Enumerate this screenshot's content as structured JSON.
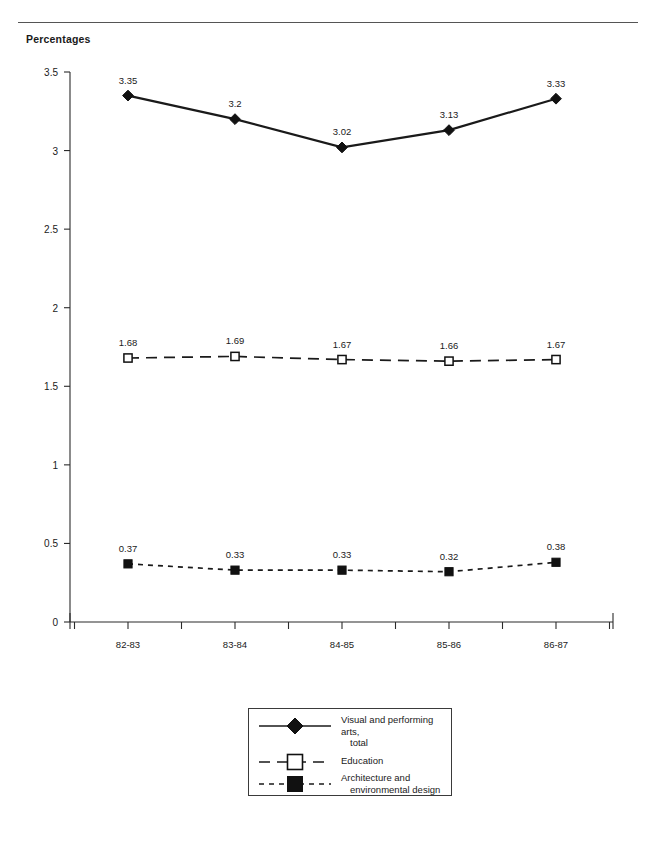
{
  "figure": {
    "axis_title": "Percentages",
    "top_rule": true
  },
  "chart_data": {
    "type": "line",
    "title": "",
    "subtitle": "",
    "xlabel": "",
    "ylabel": "Percentages",
    "categories": [
      "82-83",
      "83-84",
      "84-85",
      "85-86",
      "86-87"
    ],
    "ylim": [
      0,
      3.5
    ],
    "ytick_labels": [
      "0",
      "0.5",
      "1",
      "1.5",
      "2",
      "2.5",
      "3",
      "3.5"
    ],
    "ytick_values": [
      0,
      0.5,
      1,
      1.5,
      2,
      2.5,
      3,
      3.5
    ],
    "grid": false,
    "legend_position": "bottom-center",
    "series": [
      {
        "name": "Visual and performing arts, total",
        "legend_line1": "Visual and performing arts,",
        "legend_line2": "total",
        "marker": "filled-diamond",
        "line_style": "solid",
        "color": "#1a1a1a",
        "values": [
          3.35,
          3.2,
          3.02,
          3.13,
          3.33
        ],
        "labels": [
          "3.35",
          "3.2",
          "3.02",
          "3.13",
          "3.33"
        ]
      },
      {
        "name": "Education",
        "legend_line1": "Education",
        "legend_line2": "",
        "marker": "open-square",
        "line_style": "long-dash",
        "color": "#1a1a1a",
        "values": [
          1.68,
          1.69,
          1.67,
          1.66,
          1.67
        ],
        "labels": [
          "1.68",
          "1.69",
          "1.67",
          "1.66",
          "1.67"
        ]
      },
      {
        "name": "Architecture and environmental design",
        "legend_line1": "Architecture and",
        "legend_line2": "environmental design",
        "marker": "filled-square",
        "line_style": "short-dash",
        "color": "#1a1a1a",
        "values": [
          0.37,
          0.33,
          0.33,
          0.32,
          0.38
        ],
        "labels": [
          "0.37",
          "0.33",
          "0.33",
          "0.32",
          "0.38"
        ]
      }
    ]
  }
}
